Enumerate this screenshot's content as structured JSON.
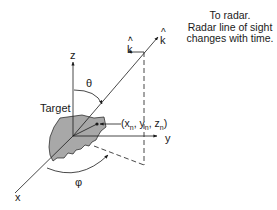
{
  "diagram": {
    "annotation": {
      "lines": [
        "To radar.",
        "Radar line of sight",
        "changes with time."
      ]
    },
    "axes": {
      "x": "x",
      "y": "y",
      "z": "z"
    },
    "vectors": {
      "k_hat": "k",
      "k_hat_accent": "^",
      "k_dot_hat": "k",
      "k_dot_hat_accent": "^",
      "k_dot_mark": "•"
    },
    "angles": {
      "theta": "θ",
      "phi": "φ"
    },
    "target_label": "Target",
    "point": {
      "label_open": "(x",
      "sub_x": "n",
      "sep1": ", y",
      "sub_y": "n",
      "sep2": ", z",
      "sub_z": "n",
      "label_close": ")"
    },
    "colors": {
      "target_fill": "#a8a8a8",
      "line": "#1a1a1a",
      "background": "#ffffff"
    }
  }
}
